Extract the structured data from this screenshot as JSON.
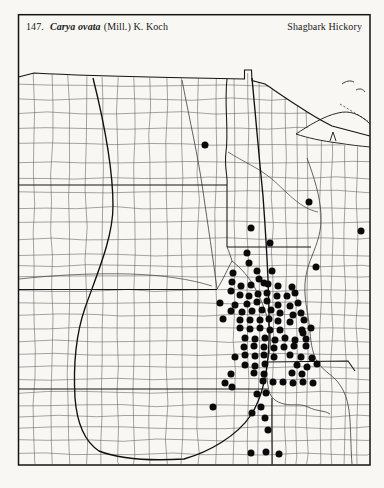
{
  "header": {
    "number": "147.",
    "species": "Carya ovata",
    "authority": "(Mill.) K. Koch",
    "common_name": "Shagbark Hickory"
  },
  "map": {
    "type": "county-dot-distribution",
    "description": "County occurrence dots on a Great Plains / upper-midwest county outline map",
    "ink_color": "#1a1a1a",
    "dot_color": "#0a0a0a",
    "dot_radius": 3.5,
    "dots": [
      [
        205,
        145
      ],
      [
        309,
        202
      ],
      [
        361,
        231
      ],
      [
        251,
        228
      ],
      [
        270,
        243
      ],
      [
        316,
        267
      ],
      [
        247,
        253
      ],
      [
        249,
        263
      ],
      [
        257,
        271
      ],
      [
        272,
        271
      ],
      [
        233,
        273
      ],
      [
        259,
        279
      ],
      [
        232,
        282
      ],
      [
        264,
        283
      ],
      [
        241,
        286
      ],
      [
        251,
        285
      ],
      [
        268,
        284
      ],
      [
        278,
        286
      ],
      [
        292,
        287
      ],
      [
        231,
        291
      ],
      [
        240,
        295
      ],
      [
        249,
        296
      ],
      [
        258,
        294
      ],
      [
        267,
        293
      ],
      [
        277,
        296
      ],
      [
        287,
        296
      ],
      [
        295,
        293
      ],
      [
        220,
        303
      ],
      [
        235,
        305
      ],
      [
        247,
        304
      ],
      [
        257,
        302
      ],
      [
        267,
        301
      ],
      [
        278,
        305
      ],
      [
        290,
        306
      ],
      [
        298,
        303
      ],
      [
        231,
        311
      ],
      [
        242,
        312
      ],
      [
        252,
        311
      ],
      [
        262,
        310
      ],
      [
        271,
        310
      ],
      [
        280,
        313
      ],
      [
        293,
        315
      ],
      [
        301,
        313
      ],
      [
        223,
        319
      ],
      [
        240,
        320
      ],
      [
        250,
        320
      ],
      [
        260,
        320
      ],
      [
        269,
        319
      ],
      [
        278,
        321
      ],
      [
        290,
        322
      ],
      [
        304,
        320
      ],
      [
        240,
        328
      ],
      [
        250,
        329
      ],
      [
        260,
        328
      ],
      [
        270,
        330
      ],
      [
        280,
        330
      ],
      [
        302,
        330
      ],
      [
        311,
        328
      ],
      [
        303,
        333
      ],
      [
        245,
        338
      ],
      [
        255,
        339
      ],
      [
        265,
        338
      ],
      [
        275,
        340
      ],
      [
        285,
        338
      ],
      [
        295,
        340
      ],
      [
        306,
        339
      ],
      [
        244,
        347
      ],
      [
        254,
        346
      ],
      [
        264,
        347
      ],
      [
        274,
        348
      ],
      [
        284,
        347
      ],
      [
        294,
        346
      ],
      [
        306,
        346
      ],
      [
        235,
        357
      ],
      [
        245,
        355
      ],
      [
        255,
        356
      ],
      [
        264,
        355
      ],
      [
        274,
        357
      ],
      [
        290,
        355
      ],
      [
        301,
        357
      ],
      [
        312,
        358
      ],
      [
        245,
        365
      ],
      [
        255,
        366
      ],
      [
        265,
        364
      ],
      [
        297,
        365
      ],
      [
        307,
        367
      ],
      [
        317,
        364
      ],
      [
        231,
        374
      ],
      [
        254,
        373
      ],
      [
        264,
        374
      ],
      [
        292,
        373
      ],
      [
        302,
        374
      ],
      [
        225,
        383
      ],
      [
        263,
        381
      ],
      [
        273,
        382
      ],
      [
        283,
        382
      ],
      [
        293,
        383
      ],
      [
        303,
        382
      ],
      [
        313,
        383
      ],
      [
        232,
        387
      ],
      [
        257,
        394
      ],
      [
        266,
        393
      ],
      [
        213,
        407
      ],
      [
        261,
        407
      ],
      [
        252,
        413
      ],
      [
        265,
        418
      ],
      [
        268,
        430
      ],
      [
        251,
        453
      ],
      [
        266,
        452
      ],
      [
        279,
        454
      ]
    ]
  }
}
